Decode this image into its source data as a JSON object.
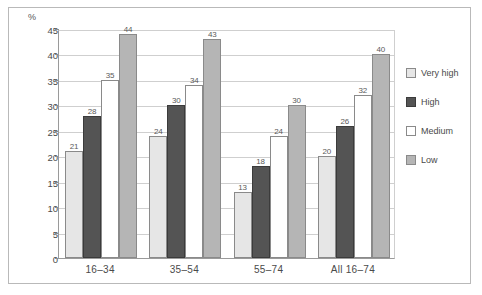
{
  "chart_data": {
    "type": "bar",
    "title": "",
    "subtitle": "",
    "xlabel": "",
    "ylabel": "%",
    "ylim": [
      0,
      45
    ],
    "ytick_step": 5,
    "yticks": [
      "0",
      "5",
      "10",
      "15",
      "20",
      "25",
      "30",
      "35",
      "40",
      "45"
    ],
    "grid": true,
    "legend_position": "right",
    "categories": [
      "16–34",
      "35–54",
      "55–74",
      "All 16–74"
    ],
    "series": [
      {
        "name": "Very high",
        "color": "#e6e6e6",
        "values": [
          21,
          24,
          13,
          20
        ]
      },
      {
        "name": "High",
        "color": "#545454",
        "values": [
          28,
          30,
          18,
          26
        ]
      },
      {
        "name": "Medium",
        "color": "#ffffff",
        "values": [
          35,
          34,
          24,
          32
        ]
      },
      {
        "name": "Low",
        "color": "#b5b5b5",
        "values": [
          44,
          43,
          30,
          40
        ]
      }
    ]
  },
  "axis": {
    "unit_label": "%"
  },
  "legend": {
    "items": [
      {
        "label": "Very high",
        "key": "veryhigh"
      },
      {
        "label": "High",
        "key": "high"
      },
      {
        "label": "Medium",
        "key": "medium"
      },
      {
        "label": "Low",
        "key": "low"
      }
    ]
  },
  "colors": {
    "very_high": "#e6e6e6",
    "high": "#545454",
    "medium": "#ffffff",
    "low": "#b5b5b5",
    "gridline": "#cfcfcf",
    "axis": "#9a9a9a",
    "frame": "#b9b9b9",
    "text": "#4a4a4a"
  }
}
